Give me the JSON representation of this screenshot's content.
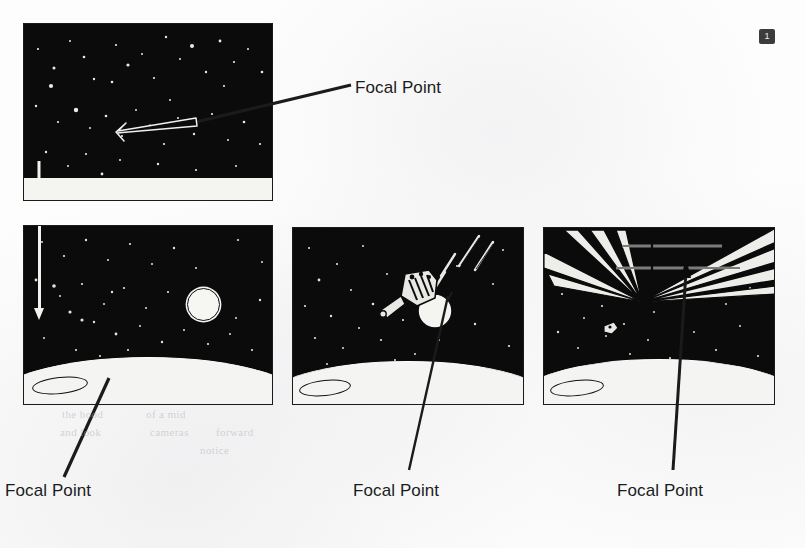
{
  "page": {
    "badge_number": "1",
    "background_color": "#fdfdfd",
    "panel_color": "#0a0a0a",
    "ink_color": "#1b1b1b",
    "highlight_color": "#f4f4f1"
  },
  "labels": {
    "focal_point_top": "Focal Point",
    "focal_point_bottom_left": "Focal Point",
    "focal_point_bottom_middle": "Focal Point",
    "focal_point_bottom_right": "Focal Point"
  },
  "panels": [
    {
      "id": "panel-upper-left",
      "name": "deep-space-starfield-panel",
      "description": "Starfield with white downward motion arrow and white horizontal band",
      "x": 23,
      "y": 23,
      "width": 250,
      "height": 178,
      "elements": [
        "starfield",
        "white-down-arrow",
        "white-band"
      ]
    },
    {
      "id": "panel-lower-left",
      "name": "planet-limb-with-moon-panel",
      "description": "Starfield over a curved planet limb with a bright disc at right",
      "x": 23,
      "y": 225,
      "width": 250,
      "height": 180,
      "elements": [
        "starfield",
        "white-down-arrow",
        "moon-disc",
        "planet-horizon",
        "limb-ellipse"
      ]
    },
    {
      "id": "panel-middle",
      "name": "spacecraft-approach-panel",
      "description": "Spacecraft with bright disc and motion streaks above a planet limb",
      "x": 292,
      "y": 227,
      "width": 232,
      "height": 178,
      "elements": [
        "starfield",
        "spacecraft",
        "moon-disc",
        "motion-streaks",
        "planet-horizon",
        "limb-ellipse"
      ]
    },
    {
      "id": "panel-right",
      "name": "converging-perspective-panel",
      "description": "Converging structural beams radiating from a single vanishing point over a planet limb",
      "x": 543,
      "y": 227,
      "width": 232,
      "height": 178,
      "elements": [
        "starfield",
        "perspective-beams",
        "vanishing-point",
        "small-craft",
        "planet-horizon",
        "limb-ellipse"
      ]
    }
  ],
  "callouts": [
    {
      "name": "callout-top",
      "label_key": "focal_point_top",
      "label_x": 355,
      "label_y": 78,
      "leader_from": [
        350,
        88
      ],
      "leader_to": [
        172,
        126
      ],
      "arrow_style": "white-outline-inside-panel",
      "target_panel": "panel-upper-left"
    },
    {
      "name": "callout-bottom-left",
      "label_key": "focal_point_bottom_left",
      "label_x": 5,
      "label_y": 481,
      "leader_from": [
        63,
        478
      ],
      "leader_to": [
        108,
        380
      ],
      "arrow_style": "plain-line",
      "target_panel": "panel-lower-left"
    },
    {
      "name": "callout-bottom-middle",
      "label_key": "focal_point_bottom_middle",
      "label_x": 353,
      "label_y": 481,
      "leader_from": [
        408,
        470
      ],
      "leader_to": [
        447,
        296
      ],
      "arrow_style": "plain-line",
      "target_panel": "panel-middle"
    },
    {
      "name": "callout-bottom-right",
      "label_key": "focal_point_bottom_right",
      "label_x": 617,
      "label_y": 481,
      "leader_from": [
        672,
        470
      ],
      "leader_to": [
        685,
        268
      ],
      "arrow_style": "solid-arrowhead",
      "target_panel": "panel-right"
    }
  ],
  "ghost_text": [
    {
      "text": "the hood",
      "x": 62,
      "y": 414
    },
    {
      "text": "of a mid",
      "x": 146,
      "y": 414
    },
    {
      "text": "and look",
      "x": 60,
      "y": 432
    },
    {
      "text": "cameras",
      "x": 150,
      "y": 432
    },
    {
      "text": "forward",
      "x": 216,
      "y": 432
    },
    {
      "text": "notice",
      "x": 200,
      "y": 450
    }
  ]
}
